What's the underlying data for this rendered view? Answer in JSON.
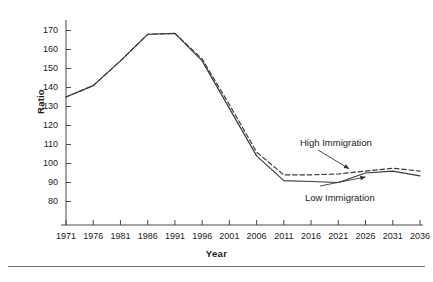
{
  "chart_data": {
    "type": "line",
    "title": "",
    "xlabel": "Year",
    "ylabel": "Ratio",
    "xlim": [
      1971,
      2036
    ],
    "ylim": [
      75,
      175
    ],
    "grid": false,
    "legend_position": "inline-annotations",
    "x": [
      1971,
      1976,
      1981,
      1986,
      1991,
      1996,
      2001,
      2006,
      2011,
      2016,
      2021,
      2026,
      2031,
      2036
    ],
    "xticks": [
      "1971",
      "1976",
      "1981",
      "1986",
      "1991",
      "1996",
      "2001",
      "2006",
      "2011",
      "2016",
      "2021",
      "2026",
      "2031",
      "2036"
    ],
    "yticks": [
      "80",
      "90",
      "100",
      "110",
      "120",
      "130",
      "140",
      "150",
      "160",
      "170"
    ],
    "series": [
      {
        "name": "High Immigration",
        "style": "dashed",
        "color": "#3a3a3a",
        "values": [
          135,
          141,
          154,
          168,
          168.5,
          155,
          131,
          106,
          94,
          94,
          94.5,
          96,
          97.5,
          96
        ]
      },
      {
        "name": "Low Immigration",
        "style": "solid",
        "color": "#3a3a3a",
        "values": [
          135,
          141,
          154,
          168,
          168.5,
          154,
          129,
          104,
          91,
          90.5,
          90,
          95,
          96,
          93.5
        ]
      }
    ],
    "annotations": [
      {
        "text": "High Immigration",
        "target_series": "High Immigration",
        "target_x": 2023
      },
      {
        "text": "Low Immigration",
        "target_series": "Low Immigration",
        "target_x": 2026
      }
    ]
  }
}
